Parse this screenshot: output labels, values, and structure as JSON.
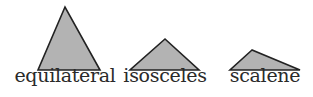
{
  "diagram": {
    "fill_color": "#b3b3b3",
    "stroke_color": "#222222",
    "triangles": [
      {
        "label": "equilateral",
        "points": "65,7 38,70 100,70",
        "label_x": 65
      },
      {
        "label": "isosceles",
        "points": "165,39 130,70 199,70",
        "label_x": 165
      },
      {
        "label": "scalene",
        "points": "252,50 230,70 300,70",
        "label_x": 265
      }
    ]
  }
}
